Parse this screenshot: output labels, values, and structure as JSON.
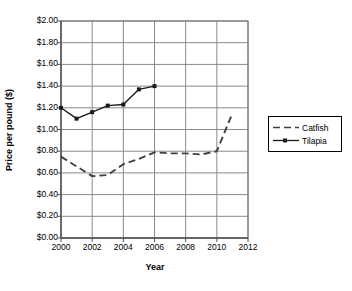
{
  "chart_data": {
    "type": "line",
    "title": "",
    "xlabel": "Year",
    "ylabel": "Price per pound ($)",
    "xlim": [
      2000,
      2012
    ],
    "ylim": [
      0.0,
      2.0
    ],
    "grid": true,
    "legend_position": "right",
    "x_ticks": [
      "2000",
      "2002",
      "2004",
      "2006",
      "2008",
      "2010",
      "2012"
    ],
    "x_tick_values": [
      2000,
      2002,
      2004,
      2006,
      2008,
      2010,
      2012
    ],
    "y_ticks": [
      "$0.00",
      "$0.20",
      "$0.40",
      "$0.60",
      "$0.80",
      "$1.00",
      "$1.20",
      "$1.40",
      "$1.60",
      "$1.80",
      "$2.00"
    ],
    "y_tick_values": [
      0.0,
      0.2,
      0.4,
      0.6,
      0.8,
      1.0,
      1.2,
      1.4,
      1.6,
      1.8,
      2.0
    ],
    "series": [
      {
        "name": "Catfish",
        "style": "dashed",
        "marker": "none",
        "color": "#404040",
        "x": [
          2000,
          2001,
          2002,
          2003,
          2004,
          2005,
          2006,
          2007,
          2008,
          2009,
          2010,
          2011
        ],
        "values": [
          0.75,
          0.66,
          0.57,
          0.58,
          0.68,
          0.73,
          0.79,
          0.78,
          0.78,
          0.77,
          0.8,
          1.15
        ]
      },
      {
        "name": "Tilapia",
        "style": "solid",
        "marker": "square",
        "color": "#1a1a1a",
        "x": [
          2000,
          2001,
          2002,
          2003,
          2004,
          2005,
          2006
        ],
        "values": [
          1.2,
          1.1,
          1.16,
          1.22,
          1.23,
          1.37,
          1.4
        ]
      }
    ]
  },
  "legend": {
    "items": [
      {
        "label": "Catfish"
      },
      {
        "label": "Tilapia"
      }
    ]
  },
  "axes": {
    "y_title": "Price per pound ($)",
    "x_title": "Year"
  },
  "colors": {
    "axis": "#6e6e6e",
    "grid": "#8a8a8a",
    "catfish": "#404040",
    "tilapia": "#1a1a1a",
    "text": "#000000"
  }
}
